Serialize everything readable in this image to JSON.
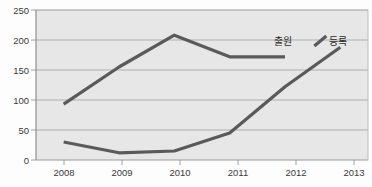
{
  "chart_data": {
    "type": "line",
    "title": "",
    "xlabel": "",
    "ylabel": "",
    "categories": [
      "2008",
      "2009",
      "2010",
      "2011",
      "2012",
      "2013"
    ],
    "x": [
      2008,
      2009,
      2010,
      2011,
      2012,
      2013
    ],
    "ylim": [
      0,
      250
    ],
    "yticks": [
      0,
      50,
      100,
      150,
      200,
      250
    ],
    "ytick_labels": [
      "0",
      "50",
      "100",
      "150",
      "200",
      "250"
    ],
    "grid": true,
    "legend_position": "inline-right-of-series",
    "series": [
      {
        "name": "출원",
        "label": "출원",
        "color": "#5a5a5a",
        "values": [
          93,
          155,
          208,
          172,
          172,
          null
        ],
        "label_x_year": 2012,
        "label_y_value": 200
      },
      {
        "name": "등록",
        "label": "등록",
        "color": "#5a5a5a",
        "values": [
          30,
          12,
          15,
          45,
          122,
          188
        ],
        "label_x_year": 2013,
        "label_y_value": 200
      }
    ]
  },
  "axes": {
    "y_tick_labels": [
      "250",
      "200",
      "150",
      "100",
      "50",
      "0"
    ],
    "x_tick_labels": [
      "2008",
      "2009",
      "2010",
      "2011",
      "2012",
      "2013"
    ]
  },
  "colors": {
    "plot_background": "#e7e7e7",
    "page_background": "#fdfdfd",
    "gridline": "#9a9a9a",
    "line": "#5a5a5a",
    "text": "#3a3a3a"
  }
}
